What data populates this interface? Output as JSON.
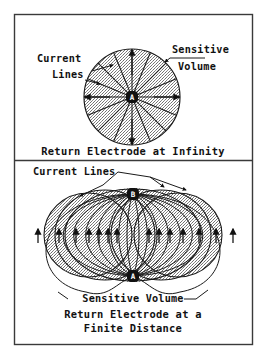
{
  "figure": {
    "background_color": "#ffffff",
    "line_color": "#1a1a1a",
    "fill_color": "#b9b9b9",
    "frame": {
      "x": 14,
      "y": 14,
      "width": 239,
      "height": 331
    },
    "divider_y": 160
  },
  "panels": [
    {
      "id": "panel-top",
      "caption": "Return Electrode at Infinity",
      "annotations": [
        {
          "id": "current-lines",
          "line1": "Current",
          "line2": "Lines"
        },
        {
          "id": "sensitive-volume",
          "line1": "Sensitive",
          "line2": "Volume"
        }
      ],
      "electrodes": [
        {
          "id": "electrode-a",
          "label": "A",
          "cx": 132,
          "cy": 97
        }
      ],
      "sensitive_volume": {
        "shape": "circle",
        "cx": 132,
        "cy": 97,
        "r": 48
      },
      "current_line_count": 16,
      "arrow_directions": [
        "up",
        "down",
        "left",
        "right"
      ]
    },
    {
      "id": "panel-bottom",
      "caption_line1": "Return Electrode at a",
      "caption_line2": "Finite Distance",
      "annotations": [
        {
          "id": "current-lines",
          "text": "Current Lines"
        },
        {
          "id": "sensitive-volume",
          "text": "Sensitive Volume"
        }
      ],
      "electrodes": [
        {
          "id": "electrode-b",
          "label": "B",
          "cx": 133,
          "cy": 194
        },
        {
          "id": "electrode-a",
          "label": "A",
          "cx": 133,
          "cy": 276
        }
      ],
      "sensitive_volume": {
        "shape": "dipole-lobes",
        "lobe_count": 7
      },
      "field_line_count": 14,
      "midline_arrow_count": 14,
      "arrow_direction": "up"
    }
  ]
}
